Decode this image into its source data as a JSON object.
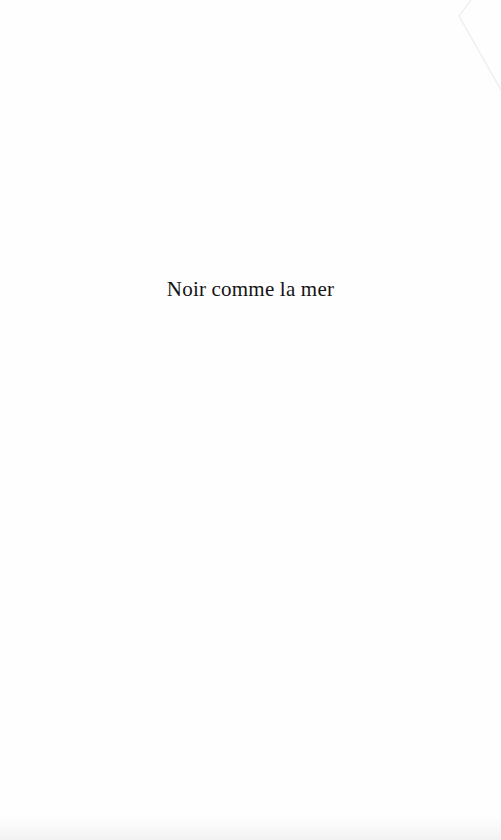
{
  "page": {
    "type": "half-title",
    "title": "Noir comme la mer",
    "background_color": "#fefefe",
    "text_color": "#141414"
  }
}
